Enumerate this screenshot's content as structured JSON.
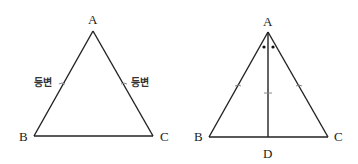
{
  "diagram": {
    "title": "",
    "left_triangle": {
      "description": "isosceles triangle with two equal sides labeled",
      "vertices": {
        "A": {
          "label": "A",
          "x": 93,
          "y": 31
        },
        "B": {
          "label": "B",
          "x": 34,
          "y": 136
        },
        "C": {
          "label": "C",
          "x": 153,
          "y": 136
        }
      },
      "side_labels": {
        "AB": "등변",
        "AC": "등변"
      }
    },
    "right_triangle": {
      "description": "isosceles triangle with angle bisector AD from apex to base",
      "vertices": {
        "A": {
          "label": "A",
          "x": 268,
          "y": 32
        },
        "B": {
          "label": "B",
          "x": 209,
          "y": 137
        },
        "C": {
          "label": "C",
          "x": 328,
          "y": 137
        },
        "D": {
          "label": "D",
          "x": 268,
          "y": 137
        }
      },
      "angle_marks": "two dots marking equal angles at A",
      "equal_side_ticks": [
        "AB",
        "AC"
      ],
      "segment_tick": "AD"
    },
    "colors": {
      "line": "#222222",
      "tick": "#888888",
      "background": "#ffffff"
    }
  }
}
